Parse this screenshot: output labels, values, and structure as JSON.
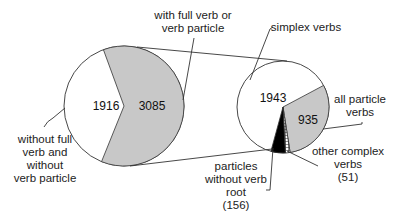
{
  "chart_data": {
    "type": "pie",
    "title": "",
    "layout": "pie-of-pie",
    "colors": {
      "shaded": "#c8c8c8",
      "white": "#ffffff",
      "black": "#000000",
      "stroke": "#333333"
    },
    "pies": [
      {
        "name": "main",
        "slices": [
          {
            "label": "without full verb and without verb particle",
            "value": 1916,
            "fill": "white"
          },
          {
            "label": "with full verb or verb particle",
            "value": 3085,
            "fill": "shaded"
          }
        ]
      },
      {
        "name": "breakdown of with full verb or verb particle",
        "slices": [
          {
            "label": "simplex verbs",
            "value": 1943,
            "fill": "white"
          },
          {
            "label": "all particle verbs",
            "value": 935,
            "fill": "shaded"
          },
          {
            "label": "other complex verbs",
            "value": 51,
            "fill": "hatched"
          },
          {
            "label": "particles without verb root",
            "value": 156,
            "fill": "black"
          }
        ]
      }
    ]
  },
  "labels": {
    "big_white_value": "1916",
    "big_grey_value": "3085",
    "small_white_value": "1943",
    "small_grey_value": "935",
    "without_full": [
      "without full",
      "verb and",
      "without",
      "verb particle"
    ],
    "with_full": [
      "with full verb or",
      "verb particle"
    ],
    "simplex": [
      "simplex verbs"
    ],
    "all_particle": [
      "all particle",
      "verbs"
    ],
    "other_complex": [
      "other complex",
      "verbs",
      "(51)"
    ],
    "particles_without": [
      "particles",
      "without verb",
      "root",
      "(156)"
    ]
  }
}
